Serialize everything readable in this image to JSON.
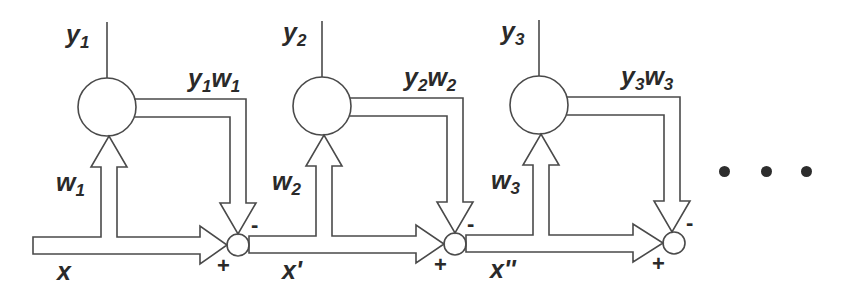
{
  "diagram": {
    "type": "cascade-neural-network",
    "stroke_color": "#4a4a4a",
    "text_color": "#2a2a2a",
    "stages": [
      {
        "output_label": "y",
        "output_sub": "1",
        "feedback_label_a": "y",
        "feedback_sub_a": "1",
        "feedback_label_b": "w",
        "feedback_sub_b": "1",
        "weight_label": "w",
        "weight_sub": "1",
        "input_label": "x",
        "minus_sign": "-",
        "plus_sign": "+"
      },
      {
        "output_label": "y",
        "output_sub": "2",
        "feedback_label_a": "y",
        "feedback_sub_a": "2",
        "feedback_label_b": "w",
        "feedback_sub_b": "2",
        "weight_label": "w",
        "weight_sub": "2",
        "input_label": "x'",
        "minus_sign": "-",
        "plus_sign": "+"
      },
      {
        "output_label": "y",
        "output_sub": "3",
        "feedback_label_a": "y",
        "feedback_sub_a": "3",
        "feedback_label_b": "w",
        "feedback_sub_b": "3",
        "weight_label": "w",
        "weight_sub": "3",
        "input_label": "x''",
        "minus_sign": "-",
        "plus_sign": "+"
      }
    ],
    "continuation": "ellipsis-dots"
  }
}
